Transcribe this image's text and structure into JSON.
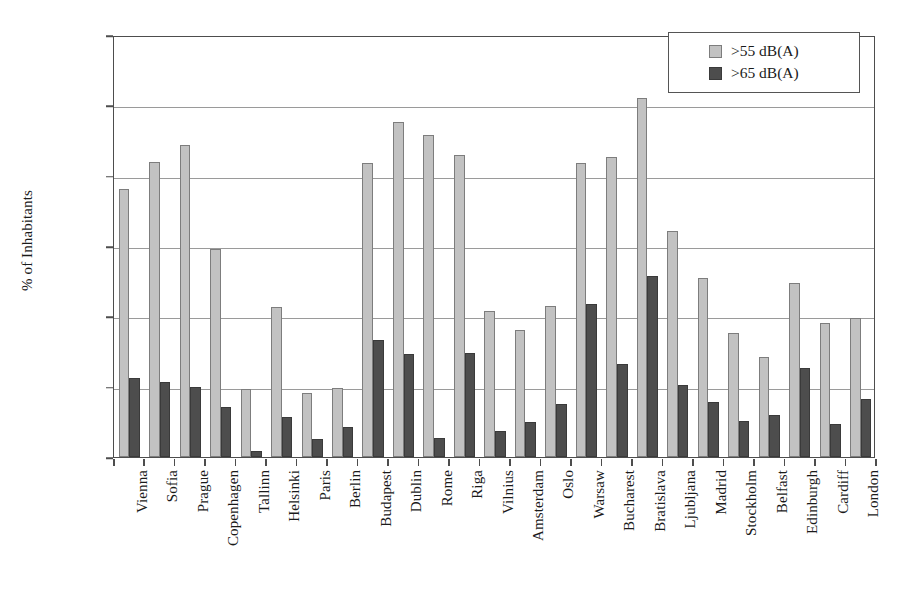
{
  "chart_data": {
    "type": "bar",
    "title": "",
    "xlabel": "",
    "ylabel": "% of Inhabitants",
    "ylim": [
      0,
      120
    ],
    "ytick_labels": [
      "0%",
      "20%",
      "40%",
      "60%",
      "80%",
      "100%",
      "120%"
    ],
    "ytick_values": [
      0,
      20,
      40,
      60,
      80,
      100,
      120
    ],
    "grid": true,
    "legend_position": "top-right",
    "categories": [
      "Vienna",
      "Sofia",
      "Prague",
      "Copenhagen",
      "Tallinn",
      "Helsinki",
      "Paris",
      "Berlin",
      "Budapest",
      "Dublin",
      "Rome",
      "Riga",
      "Vilnius",
      "Amsterdam",
      "Oslo",
      "Warsaw",
      "Bucharest",
      "Bratislava",
      "Ljubljana",
      "Madrid",
      "Stockholm",
      "Belfast",
      "Edinburgh",
      "Cardiff",
      "London"
    ],
    "series": [
      {
        "name": ">55 dB(A)",
        "color": "#c2c2c2",
        "values": [
          76.2,
          84.0,
          88.8,
          59.2,
          19.2,
          42.8,
          18.2,
          19.6,
          83.6,
          95.4,
          91.6,
          86.0,
          41.4,
          36.0,
          43.0,
          83.6,
          85.4,
          102.0,
          64.4,
          51.0,
          35.4,
          28.4,
          49.6,
          38.2,
          39.6
        ]
      },
      {
        "name": ">65 dB(A)",
        "color": "#4d4d4d",
        "values": [
          22.4,
          21.4,
          20.0,
          14.2,
          1.6,
          11.4,
          5.0,
          8.6,
          33.4,
          29.4,
          5.4,
          29.6,
          7.4,
          10.0,
          15.0,
          43.4,
          26.4,
          51.6,
          20.4,
          15.6,
          10.2,
          12.0,
          25.4,
          9.4,
          16.6
        ]
      }
    ]
  }
}
